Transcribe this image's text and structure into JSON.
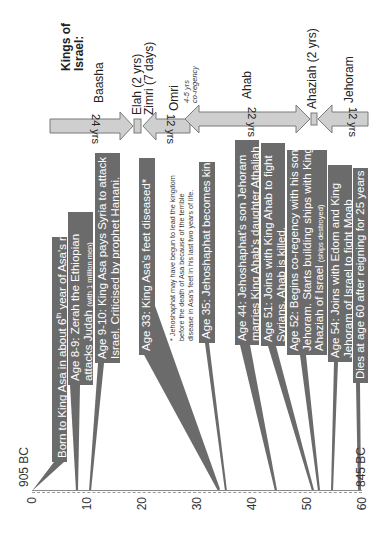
{
  "axis": {
    "ticks": [
      {
        "label": "0",
        "age": 0
      },
      {
        "label": "10",
        "age": 10
      },
      {
        "label": "20",
        "age": 20
      },
      {
        "label": "30",
        "age": 30
      },
      {
        "label": "40",
        "age": 40
      },
      {
        "label": "50",
        "age": 50
      },
      {
        "label": "60",
        "age": 60
      }
    ],
    "start_label": "905 BC",
    "end_label": "845 BC"
  },
  "events": [
    {
      "text": "Born to King Asa in about 6",
      "sup": "th",
      "text2": " year of Asa's reign",
      "age": 0
    },
    {
      "line1": "Age 8-9: Zerah the Ethiopian",
      "line2": "attacks Judah ",
      "line2_small": "(with 1 million men)",
      "age": 8
    },
    {
      "line1": "Age 9-10: King Asa pays Syria to attack",
      "line2": "Israel. Criticised by prophet Hanani.",
      "age": 10
    },
    {
      "text": "Age 33: King Asa's feet diseased*",
      "age": 33
    },
    {
      "text": "Age 35: Jehoshaphat becomes king*",
      "age": 35
    },
    {
      "line1": "Age 44: Jehoshaphat's son Jehoram",
      "line2": "marries King Ahab's daughter Athaliah",
      "age": 44
    },
    {
      "line1": "Age 51: Joins with King Ahab to fight",
      "line2": "Syrians.  Ahab is killed.",
      "age": 51
    },
    {
      "line1": "Age 52: Begins co-regency with his son",
      "line2": "Jehoram.  Starts building ships with King",
      "line3": "Ahaziah of Israel ",
      "line3_small": "(ships destroyed)",
      "age": 52
    },
    {
      "line1": "Age 54: Joins with Edom and King",
      "line2": "Jehoram of Israel to fight Moab",
      "age": 54
    },
    {
      "text": "Dies at age 60 after reigning for 25 years",
      "age": 60
    }
  ],
  "note": {
    "line1": "* Jehoshaphat may have begun to lead the kingdom",
    "line2": "before the death of Asa because of the terrible",
    "line3": "disease in Asa's feet in his last two years of life."
  },
  "kings_of_israel": {
    "title_line1": "Kings of",
    "title_line2": "Israel:",
    "kings": [
      {
        "name": "Baasha",
        "years": "24 yrs"
      },
      {
        "name": "Elah (2 yrs)"
      },
      {
        "name": "Zimri (7 days)"
      },
      {
        "name": "Omri",
        "years": "12 yrs"
      },
      {
        "name": "Ahab",
        "years": "22 yrs"
      },
      {
        "name": "Ahaziah (2 yrs)"
      },
      {
        "name": "Jehoram",
        "years": "12 yrs"
      }
    ],
    "coregency_line1": "4-5 yrs",
    "coregency_line2": "co-regency"
  },
  "colors": {
    "event_box": "#6b6b6b",
    "arrow_fill": "#cfcfcf",
    "arrow_stroke": "#7a7a7a",
    "axis": "#9a9a9a"
  }
}
